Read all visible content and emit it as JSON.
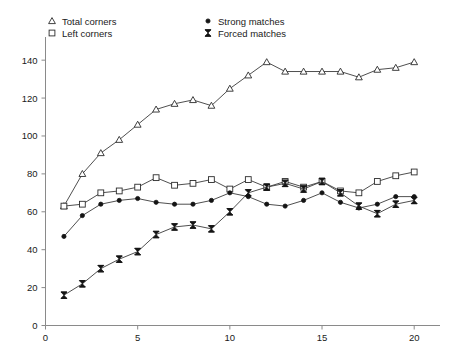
{
  "chart_data": {
    "type": "line",
    "title": "",
    "xlabel": "",
    "ylabel": "",
    "xlim": [
      0,
      21.4
    ],
    "ylim": [
      0,
      148
    ],
    "xticks": [
      0,
      5,
      10,
      15,
      20
    ],
    "xtick_labels": [
      "0",
      "5",
      "10",
      "15",
      "20"
    ],
    "yticks": [
      0,
      20,
      40,
      60,
      80,
      100,
      120,
      140
    ],
    "ytick_labels": [
      "0",
      "20",
      "40",
      "60",
      "80",
      "100",
      "120",
      "140"
    ],
    "grid": false,
    "legend_position": "top",
    "x": [
      1,
      2,
      3,
      4,
      5,
      6,
      7,
      8,
      9,
      10,
      11,
      12,
      13,
      14,
      15,
      16,
      17,
      18,
      19,
      20
    ],
    "series": [
      {
        "name": "Total corners",
        "marker": "triangle-open",
        "values": [
          63,
          80,
          91,
          98,
          106,
          114,
          117,
          119,
          116,
          125,
          132,
          139,
          134,
          134,
          134,
          134,
          131,
          135,
          136,
          139
        ]
      },
      {
        "name": "Left corners",
        "marker": "square-open",
        "values": [
          63,
          64,
          70,
          71,
          73,
          78,
          74,
          75,
          77,
          72,
          77,
          73,
          76,
          73,
          76,
          71,
          70,
          76,
          79,
          81
        ]
      },
      {
        "name": "Strong matches",
        "marker": "dot-solid",
        "values": [
          47,
          58,
          64,
          66,
          67,
          65,
          64,
          64,
          66,
          70,
          68,
          64,
          63,
          66,
          70,
          65,
          62,
          64,
          68,
          68
        ]
      },
      {
        "name": "Forced matches",
        "marker": "bowtie-solid",
        "values": [
          16,
          22,
          30,
          35,
          39,
          48,
          52,
          53,
          51,
          60,
          70,
          73,
          75,
          72,
          76,
          70,
          63,
          59,
          64,
          66
        ]
      }
    ],
    "legend": [
      {
        "label": "Total corners",
        "marker": "triangle-open"
      },
      {
        "label": "Left corners",
        "marker": "square-open"
      },
      {
        "label": "Strong matches",
        "marker": "dot-solid"
      },
      {
        "label": "Forced matches",
        "marker": "bowtie-solid"
      }
    ],
    "colors": {
      "line": "#3b3b3b",
      "marker_fill_open": "#ffffff",
      "marker_stroke": "#2b2b2b",
      "marker_fill_solid": "#141414",
      "axis": "#8a8a8a",
      "text": "#1a1a1a",
      "background": "#ffffff"
    }
  }
}
